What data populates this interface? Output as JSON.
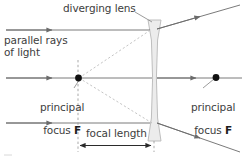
{
  "diagram": {
    "labels": {
      "diverging_lens": "diverging lens",
      "parallel_rays": "parallel rays\nof light",
      "principal_focus_left_line1": "principal",
      "principal_focus_left_line2": "focus ",
      "principal_focus_left_symbol": "F",
      "principal_focus_right_line1": "principal",
      "principal_focus_right_line2": "focus ",
      "principal_focus_right_symbol": "F",
      "focal_length": "focal length"
    },
    "colors": {
      "ray": "#6b6b6b",
      "virtual_ray_dashed": "#b0b0b0",
      "axis_dashed": "#9a9a9a",
      "lens_outline": "#b8b8b8",
      "lens_fill": "#ececec",
      "focus_dot": "#111111",
      "text": "#3d3d3d",
      "background": "#ffffff"
    },
    "geometry": {
      "lens_center_x": 154,
      "lens_top_y": 20,
      "lens_bottom_y": 141,
      "optical_axis_y": 78,
      "focus_left_x": 78,
      "focus_right_x": 216,
      "ray_top_y": 30,
      "ray_bottom_y": 123,
      "focal_length_y": 145,
      "focal_length_start_x": 78,
      "focal_length_end_x": 152
    },
    "icons": {
      "arrowhead": "ray-arrowhead-icon",
      "focus_point": "focus-point-dot-icon",
      "dimension_arrow": "double-headed-dimension-arrow-icon"
    }
  }
}
